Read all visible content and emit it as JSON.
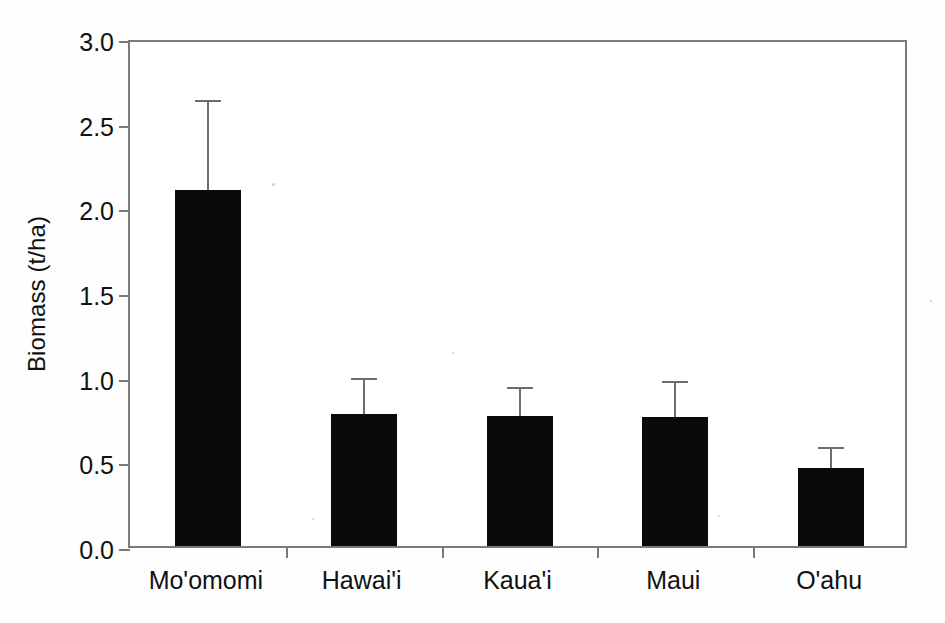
{
  "chart_data": {
    "type": "bar",
    "title": "",
    "xlabel": "",
    "ylabel": "Biomass (t/ha)",
    "categories": [
      "Mo'omomi",
      "Hawai'i",
      "Kaua'i",
      "Maui",
      "O'ahu"
    ],
    "values": [
      2.1,
      0.78,
      0.77,
      0.76,
      0.46
    ],
    "errors": [
      0.52,
      0.2,
      0.16,
      0.2,
      0.11
    ],
    "error_type": "upper-only",
    "ylim": [
      0.0,
      3.0
    ],
    "ytick_labels": [
      "0.0",
      "0.5",
      "1.0",
      "1.5",
      "2.0",
      "2.5",
      "3.0"
    ],
    "ytick_values": [
      0.0,
      0.5,
      1.0,
      1.5,
      2.0,
      2.5,
      3.0
    ],
    "grid": false,
    "legend": "none",
    "bar_color": "#0a0a0a",
    "axis_color": "#7a7a7a",
    "series": [
      {
        "name": "Biomass",
        "values": [
          2.1,
          0.78,
          0.77,
          0.76,
          0.46
        ]
      }
    ],
    "points": [
      {
        "category": "Mo'omomi",
        "value": 2.1,
        "error_upper": 0.52,
        "error_top": 2.62
      },
      {
        "category": "Hawai'i",
        "value": 0.78,
        "error_upper": 0.2,
        "error_top": 0.98
      },
      {
        "category": "Kaua'i",
        "value": 0.77,
        "error_upper": 0.16,
        "error_top": 0.93
      },
      {
        "category": "Maui",
        "value": 0.76,
        "error_upper": 0.2,
        "error_top": 0.96
      },
      {
        "category": "O'ahu",
        "value": 0.46,
        "error_upper": 0.11,
        "error_top": 0.57
      }
    ]
  }
}
